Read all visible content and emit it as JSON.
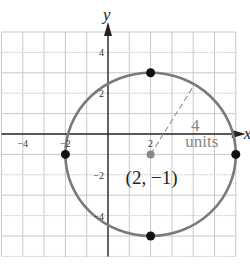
{
  "chart_data": {
    "type": "scatter",
    "title": "",
    "xlabel": "x",
    "ylabel": "y",
    "xlim": [
      -5,
      6
    ],
    "ylim": [
      -6,
      5
    ],
    "grid": true,
    "x_ticks": [
      {
        "value": -4,
        "label": "−4"
      },
      {
        "value": -2,
        "label": "−2"
      },
      {
        "value": 2,
        "label": "2"
      }
    ],
    "y_ticks": [
      {
        "value": 4,
        "label": "4"
      },
      {
        "value": 2,
        "label": "2"
      },
      {
        "value": -2,
        "label": "−2"
      },
      {
        "value": -4,
        "label": "−4"
      }
    ],
    "circle": {
      "center": [
        2,
        -1
      ],
      "radius": 4
    },
    "points": [
      {
        "name": "top",
        "x": 2,
        "y": 3
      },
      {
        "name": "bottom",
        "x": 2,
        "y": -5
      },
      {
        "name": "left",
        "x": -2,
        "y": -1
      },
      {
        "name": "right",
        "x": 6,
        "y": -1
      }
    ],
    "center_point": {
      "x": 2,
      "y": -1,
      "label": "(2, −1)"
    },
    "radius_annotation": {
      "value_label": "4",
      "unit_label": "units",
      "angle_deg": 59
    },
    "colors": {
      "circle": "#7a7a7a",
      "points": "#111111",
      "center": "#888888",
      "grid": "#c8c8c8",
      "axes": "#222222"
    }
  }
}
